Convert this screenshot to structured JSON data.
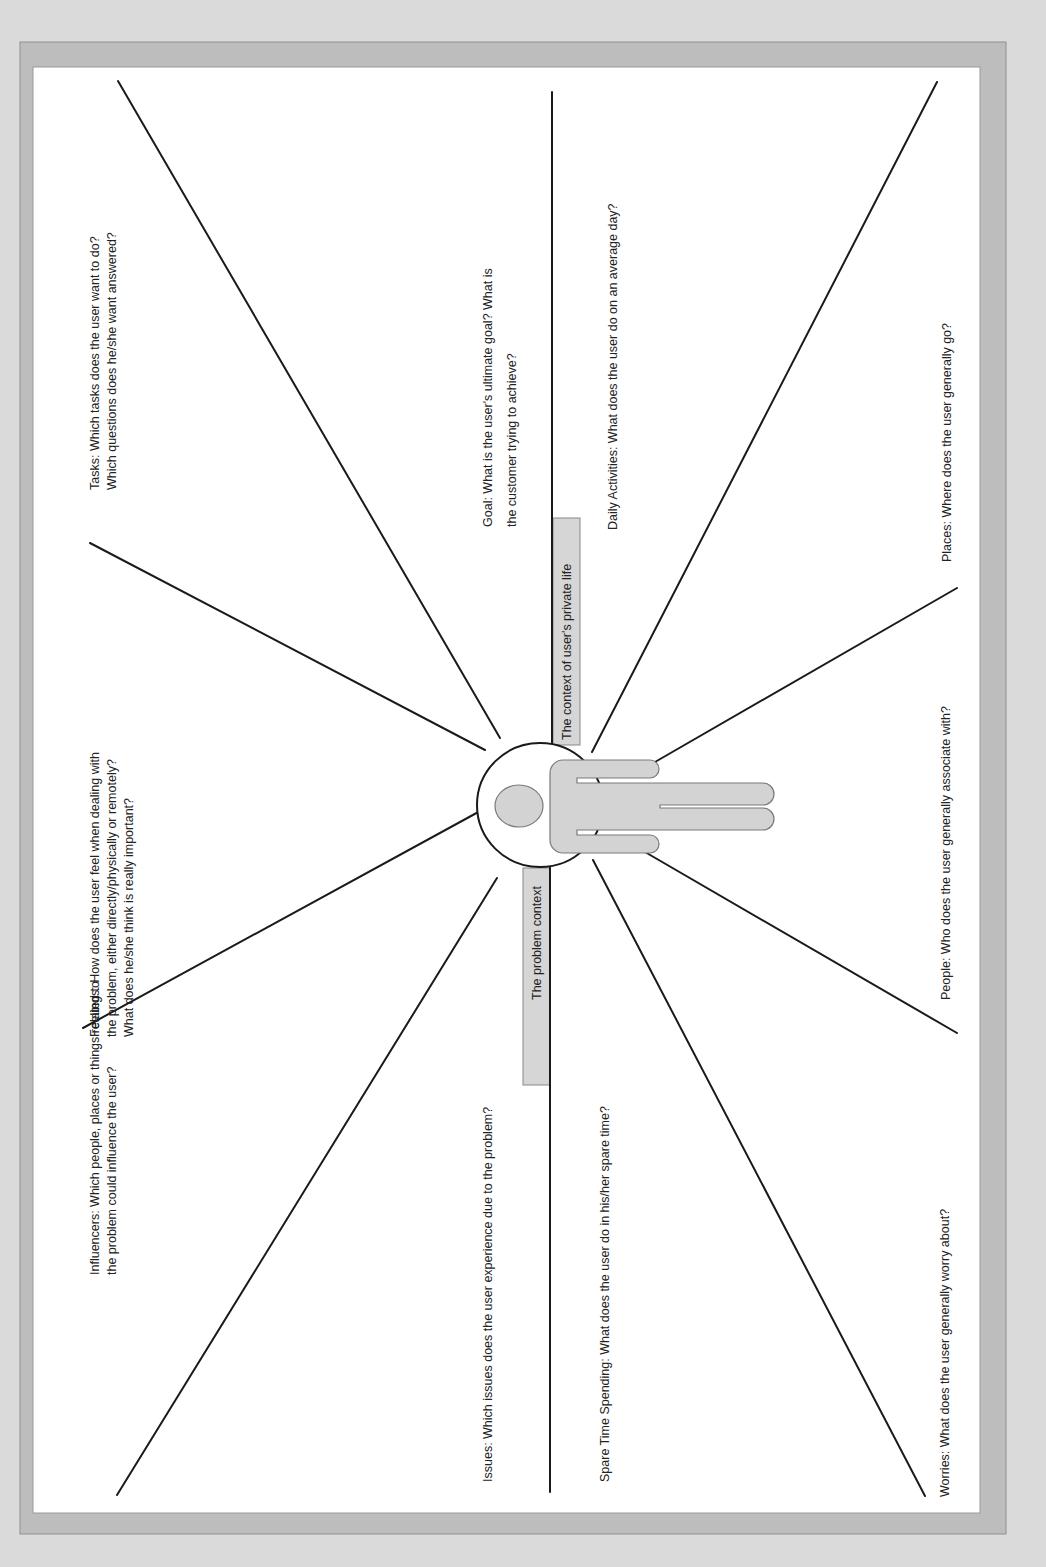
{
  "diagram": {
    "colors": {
      "page_background": "#dadada",
      "frame": "#bdbdbd",
      "canvas": "#ffffff",
      "lines": "#1a1a1a",
      "figure_fill": "#d3d3d3",
      "label_box_fill": "#d6d6d6"
    },
    "axis_labels": {
      "private_life": "The context of user's private life",
      "problem": "The problem context"
    },
    "questions": {
      "tasks": {
        "line1": "Tasks: Which tasks does the user want to do?",
        "line2": "Which questions does he/she want answered?"
      },
      "feelings": {
        "line1": "Feelings: How does the user feel when dealing with",
        "line2": "the problem, either directly/physically or remotely?",
        "line3": "What does he/she think is really important?"
      },
      "influencers": {
        "line1": "Influencers: Which people, places or things related to",
        "line2": "the problem could influence the user?"
      },
      "goal": {
        "line1": "Goal: What is the user's ultimate goal? What is",
        "line2": "the customer trying to achieve?"
      },
      "daily_activities": "Daily Activities: What does the user do on an average day?",
      "issues": "Issues: Which issues does the user experience due to the problem?",
      "spare_time": "Spare Time Spending: What does the user do in his/her spare time?",
      "places": "Places: Where does the user generally go?",
      "people": "People: Who does the user generally associate with?",
      "worries": "Worries: What does the user generally worry about?"
    },
    "center_figure": "person-icon"
  }
}
